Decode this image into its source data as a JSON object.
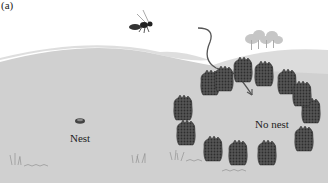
{
  "figure": {
    "panel_label": "(a)",
    "labels": {
      "nest": "Nest",
      "no_nest": "No nest"
    },
    "elements": {
      "insect": "wasp-icon",
      "flight_path": "curved-arrow",
      "nest": "nest-icon",
      "pine_cone_count": 12,
      "trees": "tree-cluster"
    },
    "colors": {
      "sky": "#ffffff",
      "near_hill": "#cfcfcf",
      "far_hill": "#dedede",
      "ground": "#d2d2d2",
      "pine_cone": "#4a4a4a",
      "text": "#1e1e1e"
    }
  }
}
